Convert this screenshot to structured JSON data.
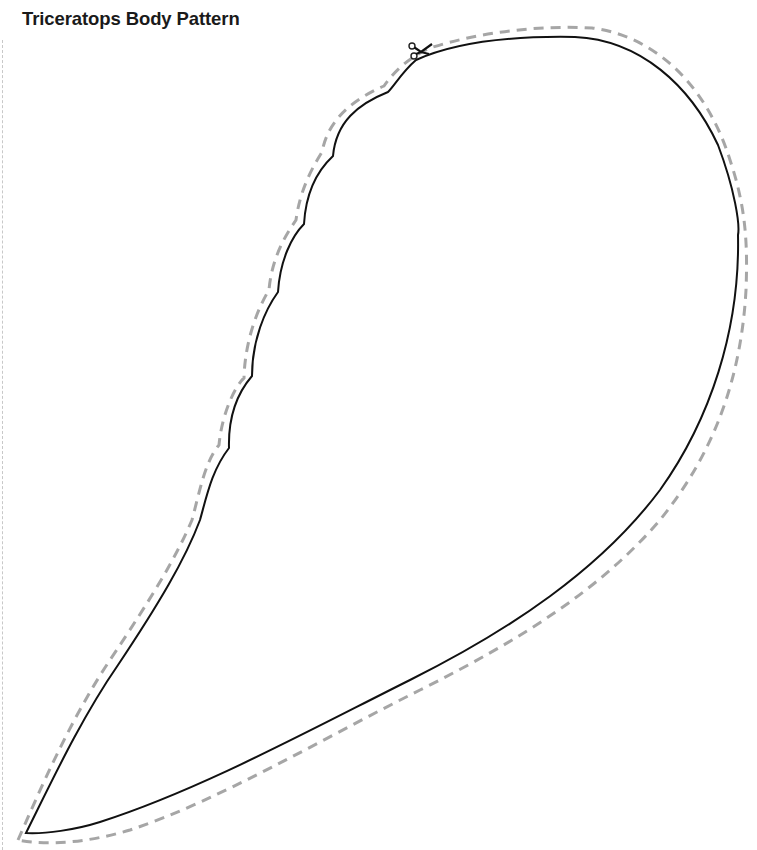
{
  "document": {
    "title": "Triceratops Body Pattern"
  },
  "pattern": {
    "shape": "triceratops-body",
    "outline_color": "#111111",
    "cut_line_color": "#a6a6a6",
    "cut_line_style": "dashed",
    "icons": [
      "scissors-icon"
    ]
  }
}
